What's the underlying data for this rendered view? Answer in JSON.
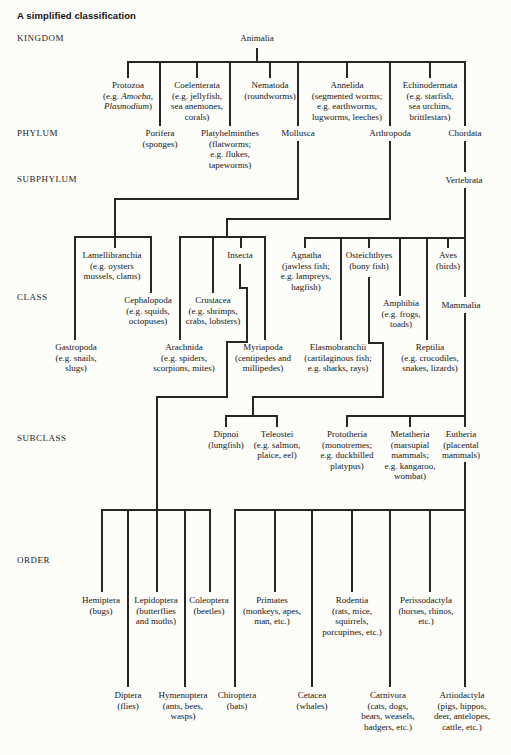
{
  "title": "A simplified classification",
  "colors": {
    "ink": "#262626",
    "text": "#161616",
    "background": "#fcfcf9"
  },
  "ranks": [
    {
      "id": "kingdom",
      "label": "KINGDOM"
    },
    {
      "id": "phylum",
      "label": "PHYLUM"
    },
    {
      "id": "subphylum",
      "label": "SUBPHYLUM"
    },
    {
      "id": "class",
      "label": "CLASS"
    },
    {
      "id": "subclass",
      "label": "SUBCLASS"
    },
    {
      "id": "order",
      "label": "ORDER"
    }
  ],
  "nodes": [
    {
      "id": "animalia",
      "rank": "kingdom",
      "name": "Animalia",
      "notes": []
    },
    {
      "id": "protozoa",
      "rank": "phylum",
      "name": "Protozoa",
      "notes": [
        "(e.g. *Amoeba*,",
        "*Plasmodium*)"
      ]
    },
    {
      "id": "coelenterata",
      "rank": "phylum",
      "name": "Coelenterata",
      "notes": [
        "(e.g. jellyfish,",
        "sea anemones,",
        "corals)"
      ]
    },
    {
      "id": "nematoda",
      "rank": "phylum",
      "name": "Nematoda",
      "notes": [
        "(roundworms)"
      ]
    },
    {
      "id": "annelida",
      "rank": "phylum",
      "name": "Annelida",
      "notes": [
        "(segmented worms;",
        "e.g. earthworms,",
        "lugworms, leeches)"
      ]
    },
    {
      "id": "echinodermata",
      "rank": "phylum",
      "name": "Echinodermata",
      "notes": [
        "(e.g. starfish,",
        "sea urchins,",
        "brittlestars)"
      ]
    },
    {
      "id": "porifera",
      "rank": "phylum",
      "name": "Porifera",
      "notes": [
        "(sponges)"
      ]
    },
    {
      "id": "platyhelminthes",
      "rank": "phylum",
      "name": "Platyhelminthes",
      "notes": [
        "(flatworms;",
        "e.g. flukes,",
        "tapeworms)"
      ]
    },
    {
      "id": "mollusca",
      "rank": "phylum",
      "name": "Mollusca",
      "notes": []
    },
    {
      "id": "arthropoda",
      "rank": "phylum",
      "name": "Arthropoda",
      "notes": []
    },
    {
      "id": "chordata",
      "rank": "phylum",
      "name": "Chordata",
      "notes": []
    },
    {
      "id": "vertebrata",
      "rank": "subphylum",
      "name": "Vertebrata",
      "notes": []
    },
    {
      "id": "lamellibranchia",
      "rank": "class",
      "name": "Lamellibranchia",
      "notes": [
        "(e.g. oysters",
        "mussels, clams)"
      ]
    },
    {
      "id": "insecta",
      "rank": "class",
      "name": "Insecta",
      "notes": []
    },
    {
      "id": "agnatha",
      "rank": "class",
      "name": "Agnatha",
      "notes": [
        "(jawless fish;",
        "e.g. lampreys,",
        "hagfish)"
      ]
    },
    {
      "id": "osteichthyes",
      "rank": "class",
      "name": "Osteichthyes",
      "notes": [
        "(bony fish)"
      ]
    },
    {
      "id": "aves",
      "rank": "class",
      "name": "Aves",
      "notes": [
        "(birds)"
      ]
    },
    {
      "id": "cephalopoda",
      "rank": "class",
      "name": "Cephalopoda",
      "notes": [
        "(e.g. squids,",
        "octopuses)"
      ]
    },
    {
      "id": "crustacea",
      "rank": "class",
      "name": "Crustacea",
      "notes": [
        "(e.g. shrimps,",
        "crabs, lobsters)"
      ]
    },
    {
      "id": "amphibia",
      "rank": "class",
      "name": "Amphibia",
      "notes": [
        "(e.g. frogs,",
        "toads)"
      ]
    },
    {
      "id": "mammalia",
      "rank": "class",
      "name": "Mammalia",
      "notes": []
    },
    {
      "id": "gastropoda",
      "rank": "class",
      "name": "Gastropoda",
      "notes": [
        "(e.g. snails,",
        "slugs)"
      ]
    },
    {
      "id": "arachnida",
      "rank": "class",
      "name": "Arachnida",
      "notes": [
        "(e.g. spiders,",
        "scorpions, mites)"
      ]
    },
    {
      "id": "myriapoda",
      "rank": "class",
      "name": "Myriapoda",
      "notes": [
        "(centipedes and",
        "millipedes)"
      ]
    },
    {
      "id": "elasmobranchii",
      "rank": "class",
      "name": "Elasmobranchii",
      "notes": [
        "(cartilaginous fish;",
        "e.g. sharks, rays)"
      ]
    },
    {
      "id": "reptilia",
      "rank": "class",
      "name": "Reptilia",
      "notes": [
        "(e.g. crocodiles,",
        "snakes, lizards)"
      ]
    },
    {
      "id": "dipnoi",
      "rank": "subclass",
      "name": "Dipnoi",
      "notes": [
        "(lungfish)"
      ]
    },
    {
      "id": "teleostei",
      "rank": "subclass",
      "name": "Teleostei",
      "notes": [
        "(e.g. salmon,",
        "plaice, eel)"
      ]
    },
    {
      "id": "prototheria",
      "rank": "subclass",
      "name": "Prototheria",
      "notes": [
        "(monotremes;",
        "e.g. duckbilled",
        "platypus)"
      ]
    },
    {
      "id": "metatheria",
      "rank": "subclass",
      "name": "Metatheria",
      "notes": [
        "(marsupial",
        "mammals;",
        "e.g. kangaroo,",
        "wombat)"
      ]
    },
    {
      "id": "eutheria",
      "rank": "subclass",
      "name": "Eutheria",
      "notes": [
        "(placental",
        "mammals)"
      ]
    },
    {
      "id": "hemiptera",
      "rank": "order",
      "name": "Hemiptera",
      "notes": [
        "(bugs)"
      ]
    },
    {
      "id": "lepidoptera",
      "rank": "order",
      "name": "Lepidoptera",
      "notes": [
        "(butterflies",
        "and moths)"
      ]
    },
    {
      "id": "coleoptera",
      "rank": "order",
      "name": "Coleoptera",
      "notes": [
        "(beetles)"
      ]
    },
    {
      "id": "primates",
      "rank": "order",
      "name": "Primates",
      "notes": [
        "(monkeys, apes,",
        "man, etc.)"
      ]
    },
    {
      "id": "rodentia",
      "rank": "order",
      "name": "Rodentia",
      "notes": [
        "(rats, mice,",
        "squirrels,",
        "porcupines, etc.)"
      ]
    },
    {
      "id": "perissodactyla",
      "rank": "order",
      "name": "Perissodactyla",
      "notes": [
        "(horses, rhinos,",
        "etc.)"
      ]
    },
    {
      "id": "diptera",
      "rank": "order",
      "name": "Diptera",
      "notes": [
        "(flies)"
      ]
    },
    {
      "id": "hymenoptera",
      "rank": "order",
      "name": "Hymenoptera",
      "notes": [
        "(ants, bees,",
        "wasps)"
      ]
    },
    {
      "id": "chiroptera",
      "rank": "order",
      "name": "Chiroptera",
      "notes": [
        "(bats)"
      ]
    },
    {
      "id": "cetacea",
      "rank": "order",
      "name": "Cetacea",
      "notes": [
        "(whales)"
      ]
    },
    {
      "id": "carnivora",
      "rank": "order",
      "name": "Carnivora",
      "notes": [
        "(cats, dogs,",
        "bears, weasels,",
        "badgers, etc.)"
      ]
    },
    {
      "id": "artiodactyla",
      "rank": "order",
      "name": "Artiodactyla",
      "notes": [
        "(pigs, hippos,",
        "deer, antelopes,",
        "cattle, etc.)"
      ]
    }
  ],
  "edges": [
    [
      "animalia",
      "protozoa"
    ],
    [
      "animalia",
      "coelenterata"
    ],
    [
      "animalia",
      "nematoda"
    ],
    [
      "animalia",
      "annelida"
    ],
    [
      "animalia",
      "echinodermata"
    ],
    [
      "animalia",
      "porifera"
    ],
    [
      "animalia",
      "platyhelminthes"
    ],
    [
      "animalia",
      "mollusca"
    ],
    [
      "animalia",
      "arthropoda"
    ],
    [
      "animalia",
      "chordata"
    ],
    [
      "chordata",
      "vertebrata"
    ],
    [
      "mollusca",
      "lamellibranchia"
    ],
    [
      "mollusca",
      "gastropoda"
    ],
    [
      "mollusca",
      "cephalopoda"
    ],
    [
      "arthropoda",
      "arachnida"
    ],
    [
      "arthropoda",
      "crustacea"
    ],
    [
      "arthropoda",
      "insecta"
    ],
    [
      "arthropoda",
      "myriapoda"
    ],
    [
      "vertebrata",
      "agnatha"
    ],
    [
      "vertebrata",
      "elasmobranchii"
    ],
    [
      "vertebrata",
      "osteichthyes"
    ],
    [
      "vertebrata",
      "amphibia"
    ],
    [
      "vertebrata",
      "reptilia"
    ],
    [
      "vertebrata",
      "aves"
    ],
    [
      "vertebrata",
      "mammalia"
    ],
    [
      "osteichthyes",
      "dipnoi"
    ],
    [
      "osteichthyes",
      "teleostei"
    ],
    [
      "mammalia",
      "prototheria"
    ],
    [
      "mammalia",
      "metatheria"
    ],
    [
      "mammalia",
      "eutheria"
    ],
    [
      "insecta",
      "hemiptera"
    ],
    [
      "insecta",
      "diptera"
    ],
    [
      "insecta",
      "lepidoptera"
    ],
    [
      "insecta",
      "hymenoptera"
    ],
    [
      "insecta",
      "coleoptera"
    ],
    [
      "eutheria",
      "chiroptera"
    ],
    [
      "eutheria",
      "primates"
    ],
    [
      "eutheria",
      "cetacea"
    ],
    [
      "eutheria",
      "rodentia"
    ],
    [
      "eutheria",
      "carnivora"
    ],
    [
      "eutheria",
      "perissodactyla"
    ],
    [
      "eutheria",
      "artiodactyla"
    ]
  ]
}
